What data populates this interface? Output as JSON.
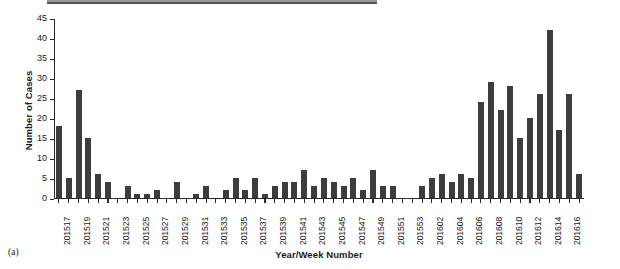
{
  "figure": {
    "panel_caption": "(a)",
    "bar_color": "#3d3d3d",
    "axis_color": "#2a2a2a"
  },
  "chart_data": {
    "type": "bar",
    "title": "",
    "xlabel": "Year/Week Number",
    "ylabel": "Number of Cases",
    "ylim": [
      0,
      45
    ],
    "ytick_step": 5,
    "yticks": [
      0,
      5,
      10,
      15,
      20,
      25,
      30,
      35,
      40,
      45
    ],
    "grid": false,
    "legend": null,
    "xtick_label_interval": 2,
    "categories": [
      "201517",
      "201518",
      "201519",
      "201520",
      "201521",
      "201522",
      "201523",
      "201524",
      "201525",
      "201526",
      "201527",
      "201528",
      "201529",
      "201530",
      "201531",
      "201532",
      "201533",
      "201534",
      "201535",
      "201536",
      "201537",
      "201538",
      "201539",
      "201540",
      "201541",
      "201542",
      "201543",
      "201544",
      "201545",
      "201546",
      "201547",
      "201548",
      "201549",
      "201550",
      "201551",
      "201552",
      "201553",
      "201601",
      "201602",
      "201603",
      "201604",
      "201605",
      "201606",
      "201607",
      "201608",
      "201609",
      "201610",
      "201611",
      "201612",
      "201613",
      "201614",
      "201615",
      "201616",
      "201617"
    ],
    "values": [
      18,
      5,
      27,
      15,
      6,
      4,
      0,
      3,
      1,
      1,
      2,
      0,
      4,
      0,
      1,
      3,
      0,
      2,
      5,
      2,
      5,
      1,
      3,
      4,
      4,
      7,
      3,
      5,
      4,
      3,
      5,
      2,
      7,
      3,
      3,
      0,
      0,
      3,
      5,
      6,
      4,
      6,
      5,
      24,
      29,
      22,
      28,
      15,
      20,
      26,
      42,
      17,
      26,
      6
    ],
    "xtick_labels_shown": [
      "201517",
      "201519",
      "201521",
      "201523",
      "201525",
      "201527",
      "201529",
      "201531",
      "201533",
      "201535",
      "201537",
      "201539",
      "201541",
      "201543",
      "201545",
      "201547",
      "201549",
      "201551",
      "201553",
      "201602",
      "201604",
      "201606",
      "201608",
      "201610",
      "201612",
      "201614",
      "201616"
    ]
  }
}
